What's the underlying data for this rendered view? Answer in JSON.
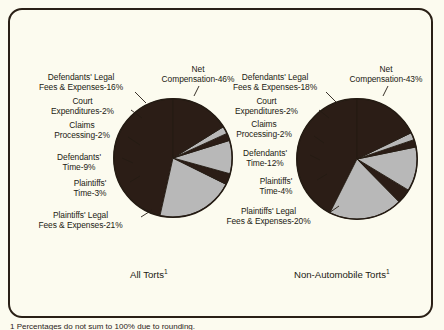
{
  "figure": {
    "background_color": "#fcfbef",
    "frame_color": "#2a2016",
    "slice_dark_color": "#2b1d16",
    "slice_light_color": "#b8b8b8",
    "footnote": "1 Percentages do not sum to 100% due to rounding."
  },
  "panels": [
    {
      "caption": "All Torts",
      "caption_superscript": "1",
      "labels": [
        {
          "lines": [
            "Net",
            "Compensation-46%"
          ]
        },
        {
          "lines": [
            "Defendants' Legal",
            "Fees & Expenses-16%"
          ]
        },
        {
          "lines": [
            "Court",
            "Expenditures-2%"
          ]
        },
        {
          "lines": [
            "Claims",
            "Processing-2%"
          ]
        },
        {
          "lines": [
            "Defendants'",
            "Time-9%"
          ]
        },
        {
          "lines": [
            "Plaintiffs'",
            "Time-3%"
          ]
        },
        {
          "lines": [
            "Plaintiffs' Legal",
            "Fees & Expenses-21%"
          ]
        }
      ]
    },
    {
      "caption": "Non-Automobile Torts",
      "caption_superscript": "1",
      "labels": [
        {
          "lines": [
            "Net",
            "Compensation-43%"
          ]
        },
        {
          "lines": [
            "Defendants' Legal",
            "Fees & Expenses-18%"
          ]
        },
        {
          "lines": [
            "Court",
            "Expenditures-2%"
          ]
        },
        {
          "lines": [
            "Claims",
            "Processing-2%"
          ]
        },
        {
          "lines": [
            "Defendants'",
            "Time-12%"
          ]
        },
        {
          "lines": [
            "Plaintiffs'",
            "Time-4%"
          ]
        },
        {
          "lines": [
            "Plaintiffs' Legal",
            "Fees & Expenses-20%"
          ]
        }
      ]
    }
  ],
  "chart_data": [
    {
      "type": "pie",
      "title": "All Torts",
      "total_label_note": "percent of tort system expenditures",
      "categories": [
        "Net Compensation",
        "Plaintiffs' Legal Fees & Expenses",
        "Plaintiffs' Time",
        "Defendants' Time",
        "Claims Processing",
        "Court Expenditures",
        "Defendants' Legal Fees & Expenses"
      ],
      "values": [
        46,
        21,
        3,
        9,
        2,
        2,
        16
      ],
      "colors": [
        "#2b1d16",
        "#b8b8b8",
        "#2b1d16",
        "#b8b8b8",
        "#2b1d16",
        "#b8b8b8",
        "#2b1d16"
      ],
      "start_angle_deg": 0,
      "direction": "counterclockwise",
      "legend": "labels-with-leader-lines"
    },
    {
      "type": "pie",
      "title": "Non-Automobile Torts",
      "total_label_note": "percent of tort system expenditures",
      "categories": [
        "Net Compensation",
        "Plaintiffs' Legal Fees & Expenses",
        "Plaintiffs' Time",
        "Defendants' Time",
        "Claims Processing",
        "Court Expenditures",
        "Defendants' Legal Fees & Expenses"
      ],
      "values": [
        43,
        20,
        4,
        12,
        2,
        2,
        18
      ],
      "colors": [
        "#2b1d16",
        "#b8b8b8",
        "#2b1d16",
        "#b8b8b8",
        "#2b1d16",
        "#b8b8b8",
        "#2b1d16"
      ],
      "start_angle_deg": 0,
      "direction": "counterclockwise",
      "legend": "labels-with-leader-lines"
    }
  ]
}
